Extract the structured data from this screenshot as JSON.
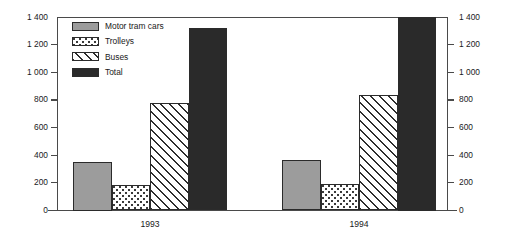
{
  "chart_data": {
    "type": "bar",
    "title": "",
    "subtitle": "",
    "xlabel": "",
    "ylabel": "",
    "ylim": [
      0,
      1400
    ],
    "y_ticks": [
      "0",
      "200",
      "400",
      "600",
      "800",
      "1 000",
      "1 200",
      "1 400"
    ],
    "y_tick_values": [
      0,
      200,
      400,
      600,
      800,
      1000,
      1200,
      1400
    ],
    "dual_axis": true,
    "right_axis_ticks": [
      "0",
      "200",
      "400",
      "600",
      "800",
      "1 000",
      "1 200",
      "1 400"
    ],
    "grid": false,
    "legend_position": "top-left-inside",
    "categories": [
      "1993",
      "1994"
    ],
    "series": [
      {
        "name": "Motor tram cars",
        "fill": "solid-gray",
        "color": "#9c9c9c",
        "values": [
          350,
          365
        ]
      },
      {
        "name": "Trolleys",
        "fill": "dotted",
        "color": "#ffffff",
        "values": [
          185,
          190
        ]
      },
      {
        "name": "Buses",
        "fill": "diagonal-hatch",
        "color": "#ffffff",
        "values": [
          775,
          835
        ]
      },
      {
        "name": "Total",
        "fill": "solid-black",
        "color": "#2a2a2a",
        "values": [
          1320,
          1400
        ]
      }
    ]
  },
  "legend": {
    "items": [
      {
        "label": "Motor tram cars",
        "fill": "solid-gray"
      },
      {
        "label": "Trolleys",
        "fill": "dotted"
      },
      {
        "label": "Buses",
        "fill": "diagonal-hatch"
      },
      {
        "label": "Total",
        "fill": "solid-black"
      }
    ]
  },
  "axis": {
    "left_labels": [
      "1 400",
      "1 200",
      "1 000",
      "800",
      "600",
      "400",
      "200",
      "0"
    ],
    "right_labels": [
      "1 400",
      "1 200",
      "1 000",
      "800",
      "600",
      "400",
      "200",
      "0"
    ]
  },
  "colors": {
    "frame": "#4a4a4a",
    "bar_outline": "#2b2b2b",
    "gray_fill": "#9c9c9c",
    "black_fill": "#2a2a2a",
    "background": "#ffffff",
    "text": "#1a1a1a"
  }
}
